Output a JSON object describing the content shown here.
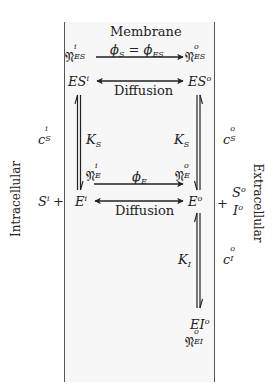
{
  "diagram": {
    "title": "Membrane",
    "compartments": {
      "left": "Intracellular",
      "right": "Extracellular"
    },
    "nodes": {
      "n_es_i": {
        "base": "𝔑",
        "sup": "i",
        "sub": "ES"
      },
      "n_es_o": {
        "base": "𝔑",
        "sup": "o",
        "sub": "ES"
      },
      "es_i": {
        "base": "ES",
        "sup": "i"
      },
      "es_o": {
        "base": "ES",
        "sup": "o"
      },
      "n_e_i": {
        "base": "𝔑",
        "sup": "i",
        "sub": "E"
      },
      "n_e_o": {
        "base": "𝔑",
        "sup": "o",
        "sub": "E"
      },
      "e_i": {
        "base": "E",
        "sup": "i"
      },
      "e_o": {
        "base": "E",
        "sup": "o"
      },
      "s_i": {
        "base": "S",
        "sup": "i"
      },
      "s_o": {
        "base": "S",
        "sup": "o"
      },
      "i_o": {
        "base": "I",
        "sup": "o"
      },
      "ei_o": {
        "base": "EI",
        "sup": "o"
      },
      "n_ei_o": {
        "base": "𝔑",
        "sup": "o",
        "sub": "EI"
      }
    },
    "concentrations": {
      "c_s_i": {
        "base": "c",
        "sup": "i",
        "sub": "S"
      },
      "c_s_o": {
        "base": "c",
        "sup": "o",
        "sub": "S"
      },
      "c_i_o": {
        "base": "c",
        "sup": "o",
        "sub": "I"
      }
    },
    "edges": {
      "flux_es": {
        "phi_s": "ϕ",
        "sub_s": "S",
        "eq": "=",
        "phi_es": "ϕ",
        "sub_es": "ES"
      },
      "diffusion_top": "Diffusion",
      "flux_e": {
        "phi": "ϕ",
        "sub": "E"
      },
      "diffusion_bottom": "Diffusion",
      "ks_left": {
        "base": "K",
        "sub": "S"
      },
      "ks_right": {
        "base": "K",
        "sub": "S"
      },
      "ki": {
        "base": "K",
        "sub": "I"
      }
    },
    "plus": "+",
    "colors": {
      "arrow": "#222222",
      "membrane_line": "#555555",
      "membrane_fill": "#f7f7f7",
      "text": "#222222"
    }
  }
}
